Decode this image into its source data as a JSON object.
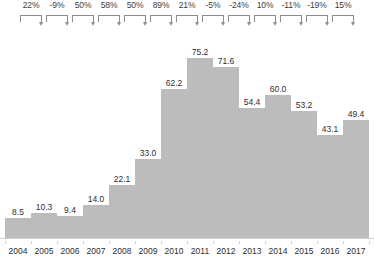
{
  "chart_data": {
    "type": "bar",
    "title": "",
    "subtitle": "",
    "xlabel": "",
    "ylabel": "",
    "ylim": [
      0,
      82
    ],
    "grid": false,
    "legend": "none",
    "categories": [
      "2004",
      "2005",
      "2006",
      "2007",
      "2008",
      "2009",
      "2010",
      "2011",
      "2012",
      "2013",
      "2014",
      "2015",
      "2016",
      "2017"
    ],
    "values": [
      8.5,
      10.3,
      9.4,
      14.0,
      22.1,
      33.0,
      62.2,
      75.2,
      71.6,
      54.4,
      60.0,
      53.2,
      43.1,
      49.4
    ],
    "value_labels": [
      "8.5",
      "10.3",
      "9.4",
      "14.0",
      "22.1",
      "33.0",
      "62.2",
      "75.2",
      "71.6",
      "54.4",
      "60.0",
      "53.2",
      "43.1",
      "49.4"
    ],
    "annotations": {
      "type": "year-over-year-growth-brackets",
      "labels": [
        "22%",
        "-9%",
        "50%",
        "58%",
        "50%",
        "89%",
        "21%",
        "-5%",
        "-24%",
        "10%",
        "-11%",
        "-19%",
        "15%"
      ],
      "values": [
        22,
        -9,
        50,
        58,
        50,
        89,
        21,
        -5,
        -24,
        10,
        -11,
        -19,
        15
      ],
      "spans": [
        [
          "2004",
          "2005"
        ],
        [
          "2005",
          "2006"
        ],
        [
          "2006",
          "2007"
        ],
        [
          "2007",
          "2008"
        ],
        [
          "2008",
          "2009"
        ],
        [
          "2009",
          "2010"
        ],
        [
          "2010",
          "2011"
        ],
        [
          "2011",
          "2012"
        ],
        [
          "2012",
          "2013"
        ],
        [
          "2013",
          "2014"
        ],
        [
          "2014",
          "2015"
        ],
        [
          "2015",
          "2016"
        ],
        [
          "2016",
          "2017"
        ]
      ]
    },
    "colors": {
      "bar": "#bcbcbc",
      "value_text": "#2e2e2e",
      "axis_text": "#2e2e2e",
      "bracket": "#8e8e8e",
      "baseline": "#d2d2d2",
      "background": "#ffffff"
    }
  }
}
